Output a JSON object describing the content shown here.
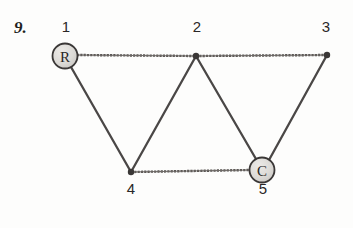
{
  "figure": {
    "problem_number": "9.",
    "kind": "undirected-graph-diagram",
    "background_color": "#fdfdfc",
    "edge_color": "#4a4746",
    "node_fill_color": "#d8d6d2",
    "node_stroke_color": "#3a3736",
    "label_color": "#2a2726"
  },
  "nodes": [
    {
      "id": "1",
      "label": "1",
      "inner_text": "R",
      "kind": "circle-node",
      "x": 65,
      "y": 56,
      "r": 12,
      "label_x": 66,
      "label_y": 30
    },
    {
      "id": "2",
      "label": "2",
      "inner_text": "",
      "kind": "dot-node",
      "x": 196,
      "y": 56,
      "r": 3,
      "label_x": 197,
      "label_y": 30
    },
    {
      "id": "3",
      "label": "3",
      "inner_text": "",
      "kind": "dot-node",
      "x": 327,
      "y": 55,
      "r": 3,
      "label_x": 326,
      "label_y": 30
    },
    {
      "id": "4",
      "label": "4",
      "inner_text": "",
      "kind": "dot-node",
      "x": 131,
      "y": 172,
      "r": 3,
      "label_x": 131,
      "label_y": 192
    },
    {
      "id": "5",
      "label": "5",
      "inner_text": "C",
      "kind": "circle-node",
      "x": 262,
      "y": 170,
      "r": 12,
      "label_x": 263,
      "label_y": 192
    }
  ],
  "edges": [
    {
      "from": "1",
      "to": "2",
      "style": "stippled"
    },
    {
      "from": "2",
      "to": "3",
      "style": "stippled"
    },
    {
      "from": "1",
      "to": "4",
      "style": "solid"
    },
    {
      "from": "2",
      "to": "4",
      "style": "solid"
    },
    {
      "from": "2",
      "to": "5",
      "style": "solid"
    },
    {
      "from": "3",
      "to": "5",
      "style": "solid"
    },
    {
      "from": "4",
      "to": "5",
      "style": "stippled"
    }
  ]
}
